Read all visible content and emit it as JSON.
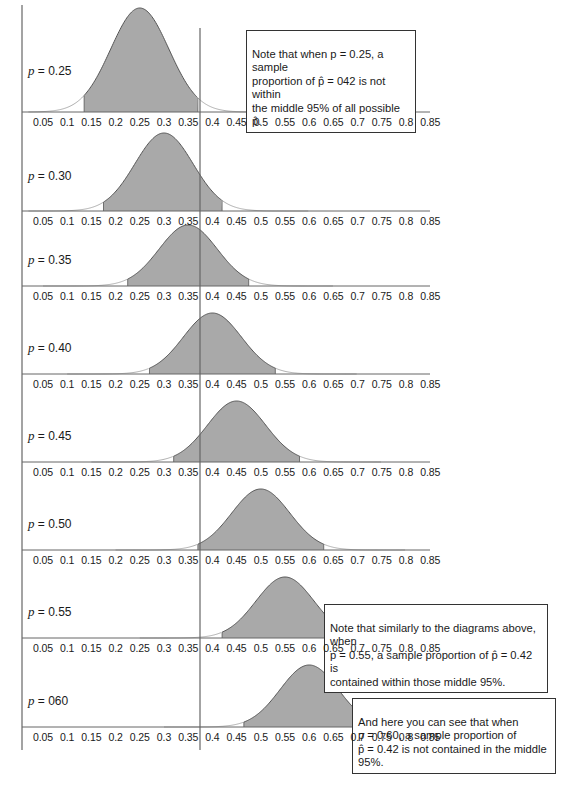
{
  "figure": {
    "axis_ticks": [
      "0.05",
      "0.1",
      "0.15",
      "0.2",
      "0.25",
      "0.3",
      "0.35",
      "0.4",
      "0.45",
      "0.5",
      "0.55",
      "0.6",
      "0.65",
      "0.7",
      "0.75",
      "0.8",
      "0.85"
    ],
    "reference_line_value": 0.42,
    "panels": [
      {
        "label": "p = 0.25",
        "p": 0.25,
        "shade_lo": 0.135,
        "shade_hi": 0.37
      },
      {
        "label": "p = 0.30",
        "p": 0.3,
        "shade_lo": 0.175,
        "shade_hi": 0.42
      },
      {
        "label": "p = 0.35",
        "p": 0.35,
        "shade_lo": 0.225,
        "shade_hi": 0.475
      },
      {
        "label": "p = 0.40",
        "p": 0.4,
        "shade_lo": 0.27,
        "shade_hi": 0.53
      },
      {
        "label": "p = 0.45",
        "p": 0.45,
        "shade_lo": 0.32,
        "shade_hi": 0.58
      },
      {
        "label": "p = 0.50",
        "p": 0.5,
        "shade_lo": 0.37,
        "shade_hi": 0.63
      },
      {
        "label": "p = 0.55",
        "p": 0.55,
        "shade_lo": 0.42,
        "shade_hi": 0.68
      },
      {
        "label": "p = 060",
        "p": 0.6,
        "shade_lo": 0.465,
        "shade_hi": 0.735
      }
    ],
    "notes": [
      {
        "id": "note-top",
        "text": "Note that when p = 0.25, a sample\nproportion of p̂ = 042 is not within\nthe middle 95% of all possible p̂."
      },
      {
        "id": "note-middle",
        "text": "Note that similarly to the diagrams above, when\np = 0.55, a sample proportion of p̂ = 0.42 is\ncontained within those middle 95%."
      },
      {
        "id": "note-bottom",
        "text": "And here you can see that when\np = 0.60, a sample proportion of\np̂ = 0.42 is not contained in the middle 95%."
      }
    ],
    "colors": {
      "shade": "#a9a9a9",
      "curve": "#555555",
      "tail": "#9a9a9a",
      "axis": "#666666"
    }
  }
}
